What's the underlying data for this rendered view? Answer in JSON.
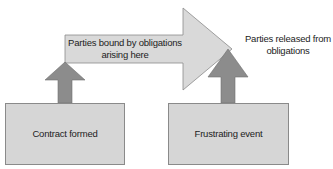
{
  "colors": {
    "box_fill": "#d6d6d6",
    "box_stroke": "#8a8a8a",
    "big_arrow_fill": "#d9d9d9",
    "up_arrow_fill": "#8c8c8c",
    "text": "#222222"
  },
  "diagram": {
    "big_arrow": {
      "label_line1": "Parties bound by obligations",
      "label_line2": "arising here"
    },
    "right_note": {
      "line1": "Parties released from",
      "line2": "obligations"
    },
    "boxes": [
      {
        "label": "Contract formed"
      },
      {
        "label": "Frustrating event"
      }
    ]
  }
}
